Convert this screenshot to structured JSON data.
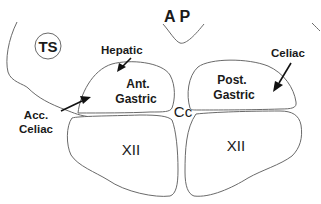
{
  "diagram": {
    "type": "anatomical schematic",
    "background": "#ffffff",
    "stroke_color": "#6a6a6a",
    "text_color": "#1a1a1a",
    "labels": {
      "ap": "A P",
      "ts": "TS",
      "hepatic": "Hepatic",
      "celiac": "Celiac",
      "acc_celiac_line1": "Acc.",
      "acc_celiac_line2": "Celiac",
      "ant_gastric_line1": "Ant.",
      "ant_gastric_line2": "Gastric",
      "post_gastric_line1": "Post.",
      "post_gastric_line2": "Gastric",
      "cc": "Cc",
      "xii_left": "XII",
      "xii_right": "XII"
    },
    "regions": [
      {
        "id": "area-postrema",
        "label": "A P"
      },
      {
        "id": "tractus-solitarius",
        "label": "TS"
      },
      {
        "id": "anterior-gastric",
        "label": "Ant. Gastric"
      },
      {
        "id": "posterior-gastric",
        "label": "Post. Gastric"
      },
      {
        "id": "central-canal",
        "label": "Cc"
      },
      {
        "id": "hypoglossal-left",
        "label": "XII"
      },
      {
        "id": "hypoglossal-right",
        "label": "XII"
      }
    ],
    "arrows": [
      {
        "label": "Hepatic",
        "points_to": "anterior-gastric"
      },
      {
        "label": "Acc. Celiac",
        "points_to": "anterior-gastric"
      },
      {
        "label": "Celiac",
        "points_to": "posterior-gastric"
      }
    ]
  }
}
